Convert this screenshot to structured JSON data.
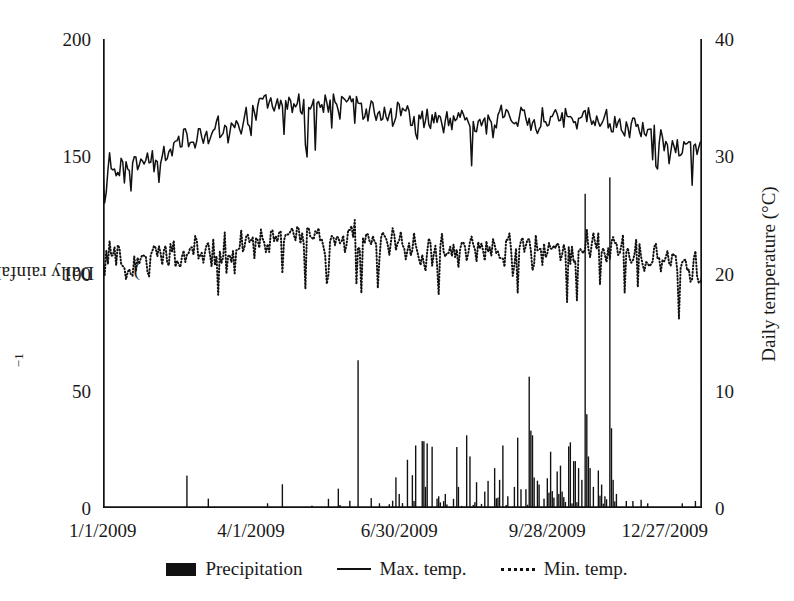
{
  "axes": {
    "left": {
      "label_prefix": "Daily rainfall (mm · day",
      "label_sup": "−1",
      "label_suffix": ")",
      "ticks": [
        0,
        50,
        100,
        150,
        200
      ],
      "min": 0,
      "max": 200
    },
    "right": {
      "label": "Daily temperature (°C)",
      "ticks": [
        0,
        10,
        20,
        30,
        40
      ],
      "min": 0,
      "max": 40
    },
    "x": {
      "ticks": [
        "1/1/2009",
        "4/1/2009",
        "6/30/2009",
        "9/28/2009",
        "12/27/2009"
      ],
      "tick_days": [
        0,
        90,
        180,
        270,
        360
      ],
      "min_day": 0,
      "max_day": 364
    }
  },
  "legend": {
    "items": [
      {
        "label": "Precipitation",
        "marker": "filled-bar",
        "color": "#111111"
      },
      {
        "label": "Max. temp.",
        "marker": "solid-line",
        "color": "#111111"
      },
      {
        "label": "Min. temp.",
        "marker": "dotted-line",
        "color": "#111111"
      }
    ]
  },
  "chart_data": {
    "type": "bar",
    "title": "",
    "xlabel": "",
    "ylabel": "Daily rainfall (mm · day−1)",
    "y2label": "Daily temperature (°C)",
    "ylim": [
      0,
      200
    ],
    "y2lim": [
      0,
      40
    ],
    "xlim": [
      0,
      364
    ],
    "grid": false,
    "legend_position": "below",
    "x_tick_labels": [
      "1/1/2009",
      "4/1/2009",
      "6/30/2009",
      "9/28/2009",
      "12/27/2009"
    ],
    "x_tick_values": [
      0,
      90,
      180,
      270,
      360
    ],
    "series": [
      {
        "name": "Precipitation",
        "type": "bar",
        "axis": "left",
        "units": "mm/day",
        "color": "#111111",
        "values": [
          0,
          0,
          0,
          0,
          0,
          0,
          0,
          0,
          0,
          0,
          0,
          0,
          0,
          0,
          0,
          0,
          0,
          0,
          0,
          0,
          0,
          0,
          0,
          0,
          0,
          0,
          0,
          0,
          0,
          0,
          0,
          0,
          0,
          0,
          0,
          0,
          0,
          0,
          0,
          0,
          0,
          0,
          0,
          0,
          0,
          0,
          0,
          0,
          0,
          0,
          0,
          0,
          0,
          0,
          0,
          0,
          0,
          0,
          0,
          0,
          0,
          0,
          0,
          0,
          4,
          0,
          0,
          0,
          0,
          0,
          0,
          0,
          0,
          0,
          0,
          0,
          0,
          0,
          0,
          0,
          0,
          0,
          0,
          0,
          0,
          0,
          0,
          0,
          0,
          0,
          0,
          0,
          0,
          0,
          0,
          0,
          0,
          0,
          0,
          0,
          2,
          0,
          0,
          0,
          0,
          0,
          0,
          0,
          0,
          0,
          0,
          0,
          0,
          0,
          0,
          0,
          0,
          0,
          0,
          0,
          0,
          0,
          0,
          0,
          0,
          0,
          0,
          1,
          0,
          0,
          0,
          0,
          0,
          0,
          0,
          0,
          0,
          0,
          0,
          0,
          0,
          0,
          0,
          0,
          0,
          0,
          0,
          0,
          0,
          0,
          0,
          0,
          0,
          0,
          0,
          63,
          0,
          0,
          0,
          0,
          0,
          0,
          0,
          0,
          0,
          0,
          0,
          0,
          0,
          0,
          0,
          0,
          0,
          0,
          0,
          0,
          0,
          0,
          0,
          0,
          0,
          0,
          0,
          0,
          0,
          0,
          0,
          0,
          2,
          0,
          0,
          0,
          0,
          0,
          0,
          0,
          0,
          0,
          0,
          0,
          14,
          2,
          0,
          0,
          0,
          0,
          0,
          0,
          0,
          0,
          0,
          0,
          0,
          0,
          0,
          0,
          0,
          9,
          0,
          0,
          0,
          0,
          0,
          0,
          4,
          5,
          0,
          0,
          1,
          6,
          0,
          0,
          0,
          0,
          0,
          0,
          0,
          0,
          0,
          0,
          0,
          0,
          0,
          0,
          0,
          0,
          0,
          0,
          0,
          0,
          0,
          0,
          0,
          0,
          0,
          0,
          0,
          0,
          0,
          0,
          0,
          0,
          0,
          0,
          0,
          0,
          0,
          0,
          0,
          0,
          0,
          0,
          0,
          0,
          0,
          0,
          0,
          0,
          0,
          0,
          0,
          0,
          0,
          0,
          0,
          0,
          0,
          0,
          0,
          0,
          0,
          0,
          0,
          0,
          0,
          0,
          0,
          0,
          0,
          0,
          0,
          0,
          0,
          0,
          0,
          0,
          0,
          0,
          0,
          0,
          0,
          0,
          0,
          0,
          0,
          0,
          0,
          0,
          0,
          0,
          0,
          0,
          0,
          0,
          0,
          0,
          0,
          0,
          0,
          0,
          0,
          0,
          0,
          0,
          0,
          0,
          0,
          0,
          0,
          0,
          0,
          0,
          0,
          0,
          0,
          0,
          0,
          0,
          0,
          0,
          0,
          0,
          0,
          0,
          0,
          0,
          0,
          0,
          0,
          0,
          0,
          0,
          0,
          0
        ]
      },
      {
        "name": "Max. temp.",
        "type": "line",
        "axis": "right",
        "units": "°C",
        "style": "solid",
        "color": "#111111",
        "approx_range": [
          26.0,
          36.0
        ],
        "monthly_mean": [
          29.3,
          30.8,
          32.4,
          34.6,
          34.8,
          33.7,
          32.9,
          33.0,
          33.2,
          33.4,
          32.6,
          30.8
        ]
      },
      {
        "name": "Min. temp.",
        "type": "line",
        "axis": "right",
        "units": "°C",
        "style": "dotted",
        "color": "#111111",
        "approx_range": [
          16.0,
          25.5
        ],
        "monthly_mean": [
          21.2,
          21.6,
          22.1,
          23.2,
          23.4,
          22.6,
          22.0,
          22.0,
          22.2,
          22.3,
          21.9,
          20.4
        ]
      }
    ],
    "notes": [
      "Precipitation is near zero Jan–Mar with isolated small events.",
      "Largest single-day totals: ~63 mm in early April, ~134 mm in mid-September, ~141 mm in late October.",
      "Monsoon period mid-June through early November carries most rainfall."
    ]
  }
}
